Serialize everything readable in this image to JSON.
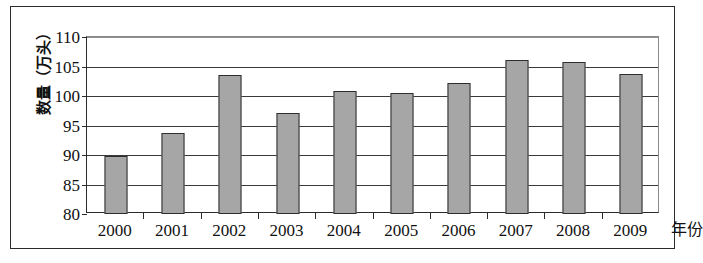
{
  "chart_data": {
    "type": "bar",
    "title": "",
    "xlabel": "年份",
    "ylabel": "数量（万头）",
    "categories": [
      "2000",
      "2001",
      "2002",
      "2003",
      "2004",
      "2005",
      "2006",
      "2007",
      "2008",
      "2009"
    ],
    "values": [
      89.9,
      93.7,
      103.5,
      97.2,
      100.8,
      100.5,
      102.2,
      106.1,
      105.7,
      103.8
    ],
    "series": [
      {
        "name": "数量（万头）",
        "values": [
          89.9,
          93.7,
          103.5,
          97.2,
          100.8,
          100.5,
          102.2,
          106.1,
          105.7,
          103.8
        ]
      }
    ],
    "ylim": [
      80,
      110
    ],
    "yticks": [
      80,
      85,
      90,
      95,
      100,
      105,
      110
    ],
    "ytick_labels": [
      "80",
      "85",
      "90",
      "95",
      "100",
      "105",
      "110"
    ],
    "grid": true,
    "grid_axis": "y",
    "legend": false,
    "legend_position": "none",
    "bar_color": "#a6a6a6",
    "bar_edge_color": "#2e2e2e",
    "axis_color": "#2b2b2b",
    "background_color": "#ffffff"
  }
}
